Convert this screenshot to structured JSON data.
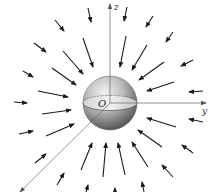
{
  "figure": {
    "labels": {
      "z_axis": "z",
      "y_axis": "y",
      "origin": "O"
    },
    "colors": {
      "arrow": "#1a1a1a",
      "axis": "#555555",
      "sphere_light": "#e6e6e6",
      "sphere_dark": "#5a5a5a",
      "background": "#ffffff"
    },
    "sphere": {
      "cx": 110,
      "cy": 103,
      "r": 27
    },
    "axes": {
      "z": {
        "x1": 110,
        "y1": 103,
        "x2": 110,
        "y2": 4
      },
      "y": {
        "x1": 110,
        "y1": 103,
        "x2": 206,
        "y2": 103
      },
      "x": {
        "x1": 110,
        "y1": 103,
        "x2": 20,
        "y2": 192
      }
    },
    "arrows": [
      [
        88,
        8,
        91,
        22
      ],
      [
        127,
        7,
        124,
        21
      ],
      [
        55,
        20,
        64,
        31
      ],
      [
        153,
        16,
        146,
        27
      ],
      [
        173,
        32,
        166,
        42
      ],
      [
        34,
        43,
        46,
        52
      ],
      [
        83,
        38,
        93,
        67
      ],
      [
        126,
        36,
        120,
        67
      ],
      [
        63,
        51,
        83,
        74
      ],
      [
        147,
        45,
        132,
        70
      ],
      [
        193,
        60,
        181,
        66
      ],
      [
        23,
        71,
        33,
        77
      ],
      [
        52,
        68,
        76,
        85
      ],
      [
        164,
        62,
        139,
        80
      ],
      [
        174,
        82,
        147,
        91
      ],
      [
        203,
        91,
        189,
        92
      ],
      [
        38,
        91,
        68,
        97
      ],
      [
        14,
        102,
        27,
        103
      ],
      [
        42,
        114,
        71,
        110
      ],
      [
        176,
        127,
        147,
        118
      ],
      [
        203,
        122,
        189,
        119
      ],
      [
        19,
        134,
        33,
        131
      ],
      [
        46,
        136,
        74,
        124
      ],
      [
        162,
        147,
        138,
        130
      ],
      [
        193,
        153,
        182,
        145
      ],
      [
        35,
        163,
        46,
        154
      ],
      [
        81,
        170,
        92,
        143
      ],
      [
        103,
        177,
        106,
        143
      ],
      [
        125,
        175,
        118,
        143
      ],
      [
        148,
        167,
        132,
        142
      ],
      [
        173,
        177,
        162,
        165
      ],
      [
        57,
        185,
        64,
        173
      ],
      [
        86,
        192,
        88,
        185
      ],
      [
        115,
        192,
        115,
        188
      ],
      [
        144,
        192,
        142,
        182
      ]
    ]
  }
}
